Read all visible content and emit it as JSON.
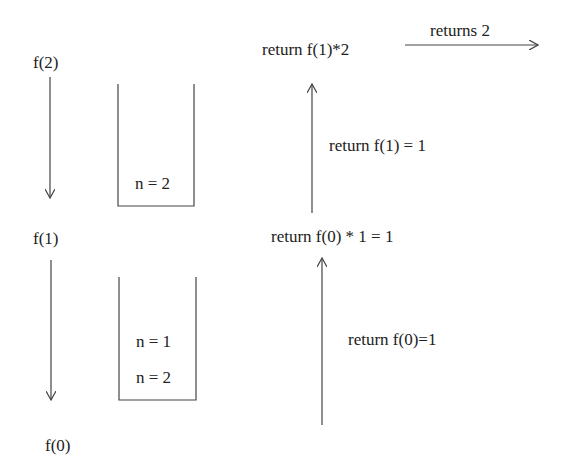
{
  "calls": {
    "f2": "f(2)",
    "f1": "f(1)",
    "f0": "f(0)"
  },
  "stack_frames": {
    "stack1": [
      "n = 2"
    ],
    "stack2": [
      "n = 1",
      "n = 2"
    ]
  },
  "returns": {
    "top": "return f(1)*2",
    "final": "returns 2",
    "mid_label": "return f(1) = 1",
    "mid": "return f(0) * 1 = 1",
    "bottom_label": "return f(0)=1"
  },
  "colors": {
    "stroke": "#444444",
    "text": "#222222"
  }
}
